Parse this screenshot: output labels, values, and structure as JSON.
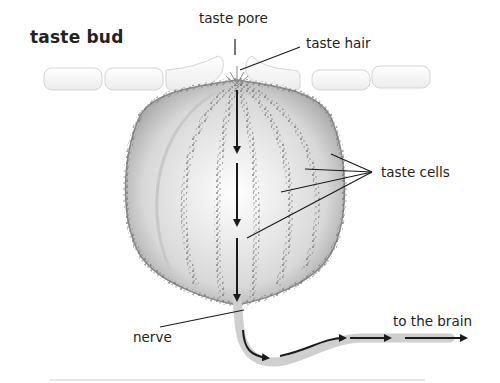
{
  "title": "taste bud",
  "labels": {
    "taste_pore": "taste pore",
    "taste_hair": "taste hair",
    "taste_cells": "taste cells",
    "nerve": "nerve",
    "to_the_brain": "to the brain"
  },
  "colors": {
    "text": "#222222",
    "cell_fill": "#f2f2f2",
    "cell_stroke": "#d0d0d0",
    "bud_shade": "#9a9a9a",
    "speckle": "#7a7a7a",
    "arrow": "#1a1a1a"
  }
}
